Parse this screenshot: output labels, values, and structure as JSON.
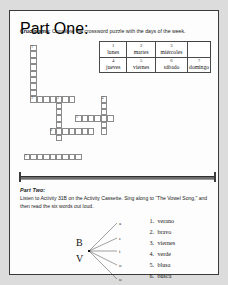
{
  "page": {
    "background_color": "#dcdcdc",
    "paper_color": "#fdfdfd",
    "border_color": "#3a3a3a"
  },
  "part_one": {
    "label": "Part One:",
    "title": "Crucigrama:",
    "instruction": "Complete the crossword puzzle with the days of the week.",
    "word_bank": {
      "row1": [
        {
          "num": "1",
          "word": "lunes"
        },
        {
          "num": "2",
          "word": "martes"
        },
        {
          "num": "3",
          "word": "miércoles"
        }
      ],
      "row2": [
        {
          "num": "4",
          "word": "jueves"
        },
        {
          "num": "5",
          "word": "viernes"
        },
        {
          "num": "6",
          "word": "sábado"
        },
        {
          "num": "7",
          "word": "domingo"
        }
      ]
    },
    "crossword": {
      "clue_numbers": [
        "1",
        "2",
        "3",
        "4",
        "5",
        "6",
        "7"
      ],
      "entries": [
        {
          "number": "1",
          "direction": "down",
          "length": 9,
          "col": 1,
          "row": 0
        },
        {
          "number": "2",
          "direction": "across",
          "length": 7,
          "col": 1,
          "row": 8
        },
        {
          "number": "3",
          "direction": "down",
          "length": 7,
          "col": 5,
          "row": 8
        },
        {
          "number": "4",
          "direction": "down",
          "length": 6,
          "col": 12,
          "row": 8
        },
        {
          "number": "5",
          "direction": "across",
          "length": 6,
          "col": 8,
          "row": 11
        },
        {
          "number": "6",
          "direction": "across",
          "length": 7,
          "col": 4,
          "row": 13
        },
        {
          "number": "7",
          "direction": "across",
          "length": 9,
          "col": 0,
          "row": 17
        }
      ]
    }
  },
  "part_two": {
    "label": "Part Two:",
    "instruction_line1": "Listen to Activity 31B on the Activity Cassette. Sing along to “The Vowel",
    "instruction_line2": "Song,” and then read the six words out loud.",
    "diagram": {
      "consonant_top": "B",
      "consonant_bottom": "V",
      "vowels": [
        "a",
        "e",
        "i",
        "o",
        "u"
      ]
    },
    "word_list": [
      {
        "num": "1.",
        "word": "verano"
      },
      {
        "num": "2.",
        "word": "bravo"
      },
      {
        "num": "3.",
        "word": "viernes"
      },
      {
        "num": "4.",
        "word": "verde"
      },
      {
        "num": "5.",
        "word": "blusa"
      },
      {
        "num": "6.",
        "word": "busca"
      }
    ]
  }
}
